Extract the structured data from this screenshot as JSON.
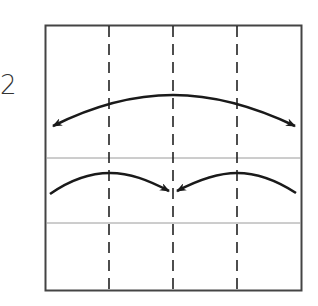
{
  "step": {
    "number": "2"
  },
  "diagram": {
    "type": "origami-fold-step",
    "square": {
      "x": 45,
      "y": 25,
      "width": 256,
      "height": 265,
      "stroke": "#333333"
    },
    "valley_fold_lines": [
      {
        "orientation": "vertical",
        "x": 109
      },
      {
        "orientation": "vertical",
        "x": 173
      },
      {
        "orientation": "vertical",
        "x": 237
      }
    ],
    "crease_lines": [
      {
        "orientation": "horizontal",
        "y": 158
      },
      {
        "orientation": "horizontal",
        "y": 223
      }
    ],
    "arrows": [
      {
        "name": "fold-arrow-top-left",
        "direction": "left"
      },
      {
        "name": "fold-arrow-top-right",
        "direction": "right"
      },
      {
        "name": "fold-arrow-bottom-left",
        "direction": "to-center"
      },
      {
        "name": "fold-arrow-bottom-right",
        "direction": "to-center"
      }
    ],
    "colors": {
      "line": "#333333",
      "crease": "#999999",
      "arrow": "#1a1a1a"
    }
  }
}
